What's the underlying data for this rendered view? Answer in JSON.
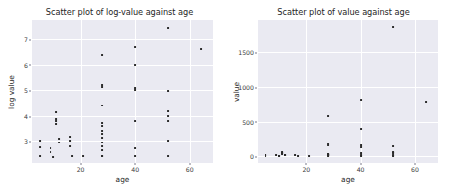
{
  "figure": {
    "width": 450,
    "height": 193,
    "background": "#ffffff",
    "plot_background": "#eaeaf2",
    "grid_color": "#ffffff",
    "marker_color": "#2b2b2b",
    "text_color": "#262626"
  },
  "chart_data": [
    {
      "type": "scatter",
      "id": "left",
      "title": "Scatter plot of log-value against age",
      "xlabel": "age",
      "ylabel": "log value",
      "xlim": [
        2.2,
        68.5
      ],
      "ylim": [
        2.15,
        7.75
      ],
      "xticks": [
        20,
        40,
        60
      ],
      "xtick_labels": [
        "20",
        "40",
        "60"
      ],
      "yticks": [
        3,
        4,
        5,
        6,
        7
      ],
      "ytick_labels": [
        "3",
        "4",
        "5",
        "6",
        "7"
      ],
      "grid": true,
      "legend": null,
      "x": [
        5,
        5,
        5,
        9,
        9,
        10,
        11,
        11,
        11,
        11,
        12,
        12,
        16,
        16,
        16,
        17,
        21,
        28,
        28,
        28,
        28,
        28,
        28,
        28,
        28,
        28,
        28,
        28,
        28,
        28,
        28,
        28,
        40,
        40,
        40,
        40,
        40,
        40,
        40,
        52,
        52,
        52,
        52,
        52,
        52,
        52,
        64
      ],
      "y": [
        3.0,
        2.78,
        2.42,
        2.72,
        2.58,
        2.4,
        4.15,
        3.88,
        3.8,
        3.68,
        3.08,
        2.95,
        3.18,
        3.0,
        2.82,
        2.42,
        2.42,
        6.37,
        5.2,
        5.12,
        4.4,
        3.72,
        3.6,
        3.42,
        3.38,
        3.3,
        3.12,
        2.95,
        2.8,
        2.65,
        2.42,
        2.42,
        6.68,
        5.98,
        5.08,
        5.0,
        3.8,
        2.72,
        2.42,
        7.45,
        4.98,
        4.18,
        4.0,
        3.8,
        3.0,
        2.42,
        6.62
      ]
    },
    {
      "type": "scatter",
      "id": "right",
      "title": "Scatter plot of value against age",
      "xlabel": "age",
      "ylabel": "value",
      "xlim": [
        2.2,
        68.5
      ],
      "ylim": [
        -95,
        1960
      ],
      "xticks": [
        20,
        40,
        60
      ],
      "xtick_labels": [
        "20",
        "40",
        "60"
      ],
      "yticks": [
        0,
        500,
        1000,
        1500
      ],
      "ytick_labels": [
        "0",
        "500",
        "1000",
        "1500"
      ],
      "grid": true,
      "legend": null,
      "x": [
        5,
        5,
        5,
        9,
        10,
        10,
        11,
        11,
        11,
        11,
        12,
        12,
        16,
        17,
        21,
        28,
        28,
        28,
        28,
        28,
        28,
        28,
        28,
        28,
        28,
        28,
        40,
        40,
        40,
        40,
        40,
        40,
        40,
        52,
        52,
        52,
        52,
        52,
        52,
        52,
        64
      ],
      "y": [
        20,
        16,
        11,
        15,
        11,
        9,
        64,
        48,
        45,
        40,
        22,
        19,
        24,
        11,
        11,
        585,
        181,
        156,
        36,
        30,
        26,
        22,
        19,
        16,
        12,
        11,
        815,
        395,
        160,
        135,
        45,
        15,
        11,
        1855,
        145,
        65,
        55,
        45,
        20,
        11,
        785
      ]
    }
  ],
  "panels": {
    "left": {
      "title": "Scatter plot of log-value against age",
      "xlabel": "age",
      "ylabel": "log value"
    },
    "right": {
      "title": "Scatter plot of value against age",
      "xlabel": "age",
      "ylabel": "value"
    }
  }
}
